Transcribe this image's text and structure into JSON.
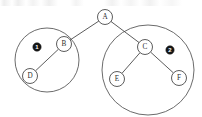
{
  "diagram": {
    "type": "tree-diagram",
    "colors": {
      "stroke": "#4a4a4a",
      "node_fill": "#ffffff",
      "badge_fill": "#161616",
      "badge_text": "#ffffff",
      "background": "#ffffff"
    },
    "nodes": [
      {
        "id": "A",
        "label": "A",
        "cx": 105,
        "cy": 17,
        "r": 7.5
      },
      {
        "id": "B",
        "label": "B",
        "cx": 64,
        "cy": 44,
        "r": 7.5
      },
      {
        "id": "C",
        "label": "C",
        "cx": 145,
        "cy": 47,
        "r": 7.5
      },
      {
        "id": "D",
        "label": "D",
        "cx": 30,
        "cy": 76,
        "r": 7.5
      },
      {
        "id": "E",
        "label": "E",
        "cx": 117,
        "cy": 79,
        "r": 7.5
      },
      {
        "id": "F",
        "label": "F",
        "cx": 179,
        "cy": 78,
        "r": 7.5
      }
    ],
    "edges": [
      {
        "from": "A",
        "to": "B"
      },
      {
        "from": "A",
        "to": "C"
      },
      {
        "from": "B",
        "to": "D"
      },
      {
        "from": "C",
        "to": "E"
      },
      {
        "from": "C",
        "to": "F"
      }
    ],
    "groups": [
      {
        "id": "group-1",
        "label": "1",
        "members": [
          "B",
          "D"
        ],
        "cx": 47,
        "cy": 60,
        "rx": 32,
        "ry": 32,
        "badge_cx": 37,
        "badge_cy": 47,
        "badge_r": 4.2
      },
      {
        "id": "group-2",
        "label": "2",
        "members": [
          "C",
          "E",
          "F"
        ],
        "cx": 148,
        "cy": 70,
        "rx": 46,
        "ry": 45,
        "badge_cx": 170,
        "badge_cy": 50,
        "badge_r": 4.2
      }
    ]
  }
}
